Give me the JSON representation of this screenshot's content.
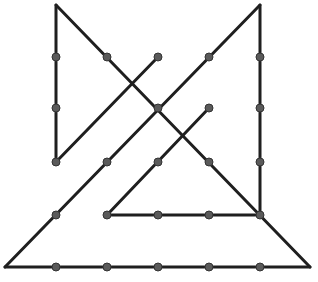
{
  "diagram": {
    "type": "connect-the-dots line puzzle",
    "line_color": "#1f1f1f",
    "dot_color": "#5a5a5a",
    "dot_stroke": "#333333",
    "line_width": 3,
    "dot_radius": 4,
    "segments": [
      {
        "name": "left-vertical",
        "points": [
          [
            56,
            5
          ],
          [
            56,
            162
          ]
        ]
      },
      {
        "name": "long-diagonal-down-right",
        "points": [
          [
            56,
            5
          ],
          [
            310,
            267
          ]
        ]
      },
      {
        "name": "left-short-diagonal-up",
        "points": [
          [
            56,
            162
          ],
          [
            158,
            57
          ]
        ]
      },
      {
        "name": "long-diagonal-down-left",
        "points": [
          [
            260,
            5
          ],
          [
            5,
            267
          ]
        ]
      },
      {
        "name": "right-vertical",
        "points": [
          [
            260,
            5
          ],
          [
            260,
            215
          ]
        ]
      },
      {
        "name": "inner-diagonal-down-left",
        "points": [
          [
            209,
            108
          ],
          [
            107,
            215
          ]
        ]
      },
      {
        "name": "inner-horizontal",
        "points": [
          [
            107,
            215
          ],
          [
            260,
            215
          ]
        ]
      },
      {
        "name": "bottom-horizontal",
        "points": [
          [
            5,
            267
          ],
          [
            310,
            267
          ]
        ]
      }
    ],
    "dots": [
      [
        56,
        57
      ],
      [
        56,
        108
      ],
      [
        56,
        162
      ],
      [
        107,
        57
      ],
      [
        158,
        57
      ],
      [
        158,
        108
      ],
      [
        209,
        57
      ],
      [
        260,
        57
      ],
      [
        260,
        108
      ],
      [
        260,
        162
      ],
      [
        209,
        108
      ],
      [
        107,
        162
      ],
      [
        158,
        162
      ],
      [
        209,
        162
      ],
      [
        56,
        215
      ],
      [
        107,
        215
      ],
      [
        158,
        215
      ],
      [
        209,
        215
      ],
      [
        260,
        215
      ],
      [
        56,
        267
      ],
      [
        107,
        267
      ],
      [
        158,
        267
      ],
      [
        209,
        267
      ],
      [
        260,
        267
      ]
    ]
  }
}
